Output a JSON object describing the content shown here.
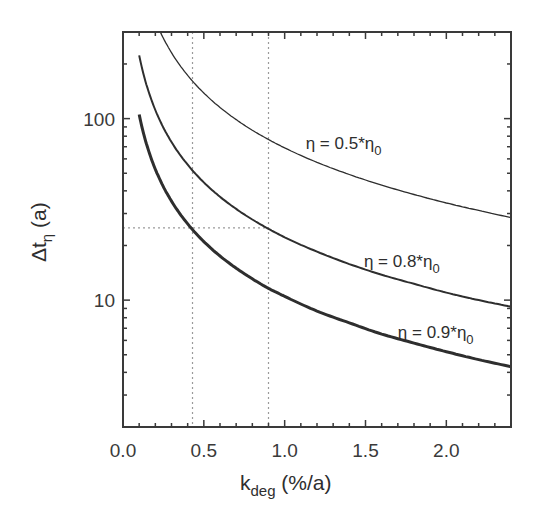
{
  "chart_data": {
    "type": "line",
    "title": "",
    "xlabel": "k_deg (%/a)",
    "xlabel_main": "k",
    "xlabel_sub": "deg",
    "xlabel_unit": " (%/a)",
    "ylabel": "Δt_η (a)",
    "ylabel_main": "Δt",
    "ylabel_sub": "η",
    "ylabel_unit": " (a)",
    "xlim": [
      0.0,
      2.4
    ],
    "ylim": [
      2,
      300
    ],
    "yscale": "log",
    "grid": false,
    "x_ticks": [
      {
        "value": 0.0,
        "label": "0.0"
      },
      {
        "value": 0.5,
        "label": "0.5"
      },
      {
        "value": 1.0,
        "label": "1.0"
      },
      {
        "value": 1.5,
        "label": "1.5"
      },
      {
        "value": 2.0,
        "label": "2.0"
      }
    ],
    "y_ticks": [
      {
        "value": 10,
        "label": "10"
      },
      {
        "value": 100,
        "label": "100"
      }
    ],
    "x": [
      0.1,
      0.15,
      0.2,
      0.25,
      0.3,
      0.4,
      0.5,
      0.6,
      0.7,
      0.8,
      0.9,
      1.0,
      1.2,
      1.4,
      1.6,
      1.8,
      2.0,
      2.2,
      2.4
    ],
    "series": [
      {
        "name": "η = 0.5*η0",
        "label_main": "η = 0.5*η",
        "label_sub": "0",
        "stroke_width": 1.3,
        "label_x": 1.13,
        "label_y": 68,
        "values": [
          692.8,
          461.7,
          346.2,
          276.9,
          230.7,
          173.0,
          138.3,
          115.2,
          98.7,
          86.3,
          76.7,
          69.0,
          57.4,
          49.2,
          43.0,
          38.2,
          34.3,
          31.2,
          28.5
        ]
      },
      {
        "name": "η = 0.8*η0",
        "label_main": "η = 0.8*η",
        "label_sub": "0",
        "stroke_width": 2.0,
        "label_x": 1.49,
        "label_y": 15.2,
        "values": [
          223.0,
          148.6,
          111.5,
          89.1,
          74.3,
          55.7,
          44.5,
          37.1,
          31.8,
          27.8,
          24.7,
          22.2,
          18.5,
          15.8,
          13.8,
          12.3,
          11.0,
          10.0,
          9.2
        ]
      },
      {
        "name": "η = 0.9*η0",
        "label_main": "η = 0.9*η",
        "label_sub": "0",
        "stroke_width": 3.0,
        "label_x": 1.7,
        "label_y": 6.2,
        "values": [
          105.3,
          70.2,
          52.6,
          42.1,
          35.1,
          26.3,
          21.0,
          17.5,
          15.0,
          13.1,
          11.6,
          10.5,
          8.7,
          7.5,
          6.5,
          5.8,
          5.2,
          4.7,
          4.3
        ]
      }
    ],
    "reference_lines": [
      {
        "orientation": "vertical",
        "value": 0.43
      },
      {
        "orientation": "vertical",
        "value": 0.9
      },
      {
        "orientation": "horizontal",
        "value": 25,
        "x_from": 0.0,
        "x_to": 0.9
      }
    ],
    "colors": {
      "axis": "#3a3a3a",
      "curve": "#2e2e2e",
      "reference": "#9a9a9a"
    }
  }
}
